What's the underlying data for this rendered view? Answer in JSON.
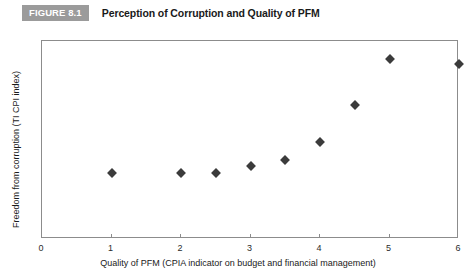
{
  "header": {
    "figure_badge": "FIGURE 8.1",
    "figure_badge_color": "#9b9b9b",
    "title": "Perception of Corruption and Quality of PFM"
  },
  "chart_data": {
    "type": "scatter",
    "title": "Perception of Corruption and Quality of PFM",
    "xlabel": "Quality of PFM (CPIA indicator on budget and financial management)",
    "ylabel": "Freedom from corruption (TI CPI index)",
    "xlim": [
      0,
      6
    ],
    "ylim": [
      0,
      6
    ],
    "xticks": [
      0,
      1,
      2,
      3,
      4,
      5,
      6
    ],
    "yticks": [
      0,
      1,
      2,
      3,
      4,
      5,
      6
    ],
    "xtick_labels": [
      "0",
      "1",
      "2",
      "3",
      "4",
      "5",
      "6"
    ],
    "ytick_labels": [
      "0",
      "1",
      "2",
      "3",
      "4",
      "5",
      "6"
    ],
    "grid": false,
    "legend": false,
    "marker": "diamond",
    "marker_color": "#3b3b3b",
    "points": [
      {
        "x": 1.0,
        "y": 2.0
      },
      {
        "x": 2.0,
        "y": 2.0
      },
      {
        "x": 2.5,
        "y": 2.0
      },
      {
        "x": 3.0,
        "y": 2.2
      },
      {
        "x": 3.5,
        "y": 2.4
      },
      {
        "x": 4.0,
        "y": 2.95
      },
      {
        "x": 4.5,
        "y": 4.05
      },
      {
        "x": 5.0,
        "y": 5.45
      },
      {
        "x": 6.0,
        "y": 5.3
      }
    ]
  }
}
